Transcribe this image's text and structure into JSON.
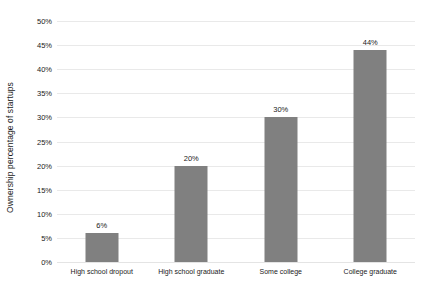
{
  "chart_data": {
    "type": "bar",
    "title": "",
    "xlabel": "",
    "ylabel": "Ownership percentage of startups",
    "categories": [
      "High school dropout",
      "High school graduate",
      "Some college",
      "College graduate"
    ],
    "values": [
      6,
      20,
      30,
      44
    ],
    "value_labels": [
      "6%",
      "20%",
      "30%",
      "44%"
    ],
    "ylim": [
      0,
      50
    ],
    "ytick_values": [
      0,
      5,
      10,
      15,
      20,
      25,
      30,
      35,
      40,
      45,
      50
    ],
    "ytick_labels": [
      "0%",
      "5%",
      "10%",
      "15%",
      "20%",
      "25%",
      "30%",
      "35%",
      "40%",
      "45%",
      "50%"
    ],
    "grid": true,
    "legend": "none",
    "bar_color": "#808080",
    "gridline_color": "#e9e9e9",
    "text_color": "#1a1a1a",
    "background_color": "#ffffff"
  }
}
